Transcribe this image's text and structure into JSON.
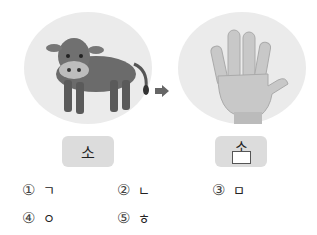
{
  "images": {
    "left": {
      "subject": "cow-illustration",
      "caption": "소"
    },
    "right": {
      "subject": "open-hand-illustration",
      "caption_top": "소",
      "caption_blank": ""
    }
  },
  "arrow": "right-arrow",
  "options": [
    {
      "num": "①",
      "value": "ㄱ"
    },
    {
      "num": "②",
      "value": "ㄴ"
    },
    {
      "num": "③",
      "value": "ㅁ"
    },
    {
      "num": "④",
      "value": "ㅇ"
    },
    {
      "num": "⑤",
      "value": "ㅎ"
    }
  ],
  "colors": {
    "circle": "#ebebeb",
    "box": "#dcdcdc",
    "arrow": "#666666"
  }
}
